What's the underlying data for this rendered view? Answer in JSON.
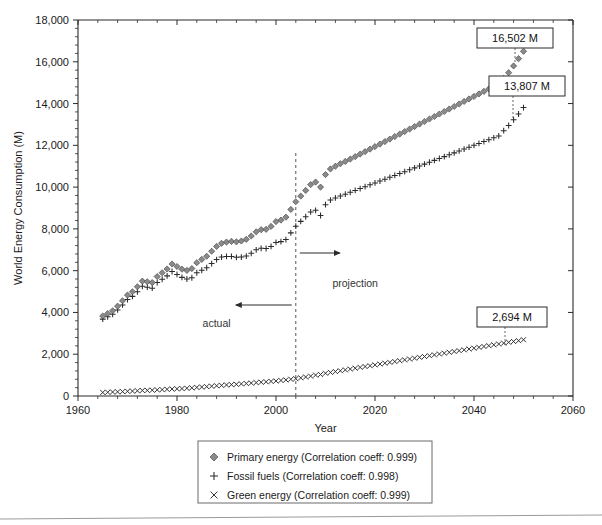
{
  "chart_data": {
    "type": "scatter",
    "title": "",
    "xlabel": "Year",
    "ylabel": "World Energy Consumption (M)",
    "xlim": [
      1960,
      2060
    ],
    "ylim": [
      0,
      18000
    ],
    "xticks": [
      1960,
      1980,
      2000,
      2020,
      2040,
      2060
    ],
    "xticklabels": [
      "1960",
      "1980",
      "2000",
      "2020",
      "2040",
      "2060"
    ],
    "yticks": [
      0,
      2000,
      4000,
      6000,
      8000,
      10000,
      12000,
      14000,
      16000,
      18000
    ],
    "yticklabels": [
      "0",
      "2,000",
      "4,000",
      "6,000",
      "8,000",
      "10,000",
      "12,000",
      "14,000",
      "16,000",
      "18,000"
    ],
    "x_minor_ticks_per_major": 4,
    "y_minor_ticks_per_major": 4,
    "grid": false,
    "legend_position": "below-plot",
    "projection_boundary_year": 2004,
    "annotations": [
      {
        "name": "actual-label",
        "text": "actual",
        "x": 1988,
        "y": 3300
      },
      {
        "name": "projection-label",
        "text": "projection",
        "x": 2016,
        "y": 5200
      }
    ],
    "callouts": [
      {
        "name": "primary-energy-endpoint",
        "text": "16,502 M",
        "value": 16502,
        "series": "Primary energy",
        "year": 2050
      },
      {
        "name": "fossil-fuels-endpoint",
        "text": "13,807 M",
        "value": 13807,
        "series": "Fossil fuels",
        "year": 2050
      },
      {
        "name": "green-energy-endpoint",
        "text": "2,694 M",
        "value": 2694,
        "series": "Green energy",
        "year": 2050
      }
    ],
    "x": [
      1965,
      1966,
      1967,
      1968,
      1969,
      1970,
      1971,
      1972,
      1973,
      1974,
      1975,
      1976,
      1977,
      1978,
      1979,
      1980,
      1981,
      1982,
      1983,
      1984,
      1985,
      1986,
      1987,
      1988,
      1989,
      1990,
      1991,
      1992,
      1993,
      1994,
      1995,
      1996,
      1997,
      1998,
      1999,
      2000,
      2001,
      2002,
      2003,
      2004,
      2005,
      2006,
      2007,
      2008,
      2009,
      2010,
      2011,
      2012,
      2013,
      2014,
      2015,
      2016,
      2017,
      2018,
      2019,
      2020,
      2021,
      2022,
      2023,
      2024,
      2025,
      2026,
      2027,
      2028,
      2029,
      2030,
      2031,
      2032,
      2033,
      2034,
      2035,
      2036,
      2037,
      2038,
      2039,
      2040,
      2041,
      2042,
      2043,
      2044,
      2045,
      2046,
      2047,
      2048,
      2049,
      2050
    ],
    "series": [
      {
        "name": "Primary energy",
        "marker": "diamond",
        "correlation_coeff": 0.999,
        "legend_label": "Primary energy (Correlation coeff: 0.999)",
        "values": [
          3830,
          3950,
          4080,
          4300,
          4560,
          4830,
          4990,
          5230,
          5500,
          5470,
          5430,
          5720,
          5900,
          6080,
          6320,
          6200,
          6070,
          6010,
          6100,
          6380,
          6540,
          6690,
          6930,
          7160,
          7310,
          7370,
          7400,
          7380,
          7420,
          7500,
          7660,
          7860,
          7960,
          7980,
          8120,
          8350,
          8420,
          8560,
          8930,
          9300,
          9570,
          9840,
          10120,
          10240,
          10000,
          10600,
          10870,
          11000,
          11120,
          11230,
          11340,
          11460,
          11580,
          11700,
          11820,
          11940,
          12060,
          12180,
          12300,
          12420,
          12540,
          12660,
          12780,
          12900,
          13020,
          13140,
          13260,
          13380,
          13500,
          13620,
          13740,
          13860,
          13980,
          14100,
          14220,
          14340,
          14460,
          14580,
          14700,
          14820,
          14940,
          15200,
          15480,
          15800,
          16150,
          16502
        ]
      },
      {
        "name": "Fossil fuels",
        "marker": "plus",
        "correlation_coeff": 0.998,
        "legend_label": "Fossil fuels (Correlation coeff: 0.998)",
        "values": [
          3680,
          3790,
          3910,
          4120,
          4360,
          4620,
          4770,
          4990,
          5250,
          5210,
          5160,
          5430,
          5590,
          5750,
          5960,
          5820,
          5680,
          5600,
          5660,
          5900,
          6020,
          6140,
          6340,
          6530,
          6650,
          6680,
          6680,
          6640,
          6650,
          6700,
          6830,
          7000,
          7070,
          7060,
          7160,
          7350,
          7390,
          7490,
          7810,
          8130,
          8360,
          8580,
          8810,
          8890,
          8640,
          9160,
          9380,
          9480,
          9570,
          9660,
          9750,
          9840,
          9930,
          10020,
          10110,
          10200,
          10290,
          10380,
          10470,
          10560,
          10650,
          10740,
          10830,
          10920,
          11010,
          11100,
          11190,
          11280,
          11370,
          11460,
          11550,
          11640,
          11730,
          11820,
          11910,
          12000,
          12090,
          12180,
          12270,
          12360,
          12450,
          12700,
          12950,
          13220,
          13500,
          13807
        ]
      },
      {
        "name": "Green energy",
        "marker": "cross",
        "correlation_coeff": 0.999,
        "legend_label": "Green energy (Correlation coeff: 0.999)",
        "values": [
          170,
          180,
          190,
          200,
          210,
          225,
          235,
          250,
          265,
          270,
          280,
          295,
          305,
          320,
          335,
          345,
          355,
          370,
          390,
          410,
          430,
          450,
          470,
          490,
          510,
          530,
          545,
          560,
          580,
          600,
          620,
          640,
          660,
          680,
          700,
          720,
          745,
          770,
          800,
          830,
          870,
          910,
          950,
          1000,
          1030,
          1090,
          1130,
          1170,
          1210,
          1250,
          1290,
          1330,
          1370,
          1410,
          1450,
          1490,
          1530,
          1570,
          1610,
          1650,
          1690,
          1730,
          1770,
          1810,
          1850,
          1890,
          1930,
          1970,
          2010,
          2050,
          2090,
          2130,
          2170,
          2210,
          2250,
          2290,
          2330,
          2370,
          2410,
          2450,
          2490,
          2530,
          2570,
          2610,
          2650,
          2694
        ]
      }
    ],
    "colors": {
      "axis": "#2b2b2b",
      "primary_marker_fill": "#8a8a8a",
      "primary_marker_stroke": "#3a3a3a",
      "fossil_marker": "#2b2b2b",
      "green_marker": "#2b2b2b",
      "projection_line": "#555555",
      "background": "#ffffff"
    }
  }
}
